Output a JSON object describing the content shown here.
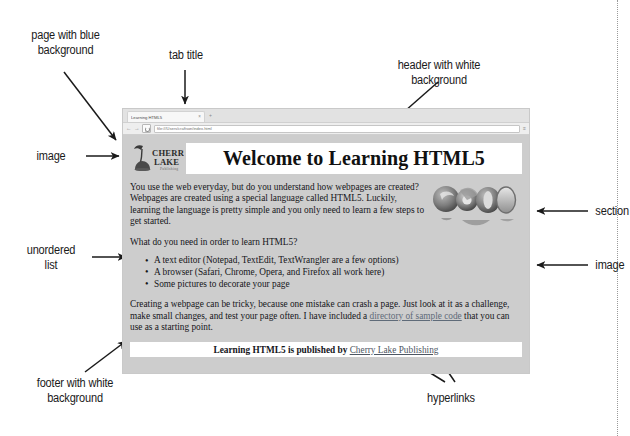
{
  "annotations": [
    {
      "id": "page-blue-bg",
      "text": "page with blue\nbackground"
    },
    {
      "id": "tab-title",
      "text": "tab title"
    },
    {
      "id": "header-white-bg",
      "text": "header with white\nbackground"
    },
    {
      "id": "image-left",
      "text": "image"
    },
    {
      "id": "unordered-list",
      "text": "unordered\nlist"
    },
    {
      "id": "section",
      "text": "section"
    },
    {
      "id": "image-right",
      "text": "image"
    },
    {
      "id": "footer-white-bg",
      "text": "footer with white\nbackground"
    },
    {
      "id": "hyperlinks",
      "text": "hyperlinks"
    }
  ],
  "browser": {
    "tab_title": "Learning HTML5",
    "tab_close_glyph": "×",
    "new_tab_glyph": "+",
    "back_glyph": "←",
    "forward_glyph": "→",
    "menu_glyph": "≡",
    "url": "file:///Users/craftson/index.html"
  },
  "page": {
    "logo": {
      "line1": "CHERRY",
      "line2": "LAKE",
      "line3": "Publishing"
    },
    "header_title": "Welcome to Learning HTML5",
    "paragraph1": "You use the web everyday, but do you understand how webpages are created? Webpages are created using a special language called HTML5. Luckily, learning the language is pretty simple and you only need to learn a few steps to get started.",
    "paragraph2": "What do you need in order to learn HTML5?",
    "list_items": [
      "A text editor (Notepad, TextEdit, TextWrangler are a few options)",
      "A browser (Safari, Chrome, Opera, and Firefox all work here)",
      "Some pictures to decorate your page"
    ],
    "paragraph3_before": "Creating a webpage can be tricky, because one mistake can crash a page. Just look at it as a challenge, make small changes, and test your page often. I have included a ",
    "paragraph3_link": "directory of sample code",
    "paragraph3_after": " that you can use as a starting point.",
    "footer_before": "Learning HTML5 is published by ",
    "footer_link": "Cherry Lake Publishing"
  },
  "colors": {
    "page_background": "#cdcdcd",
    "header_background": "#ffffff",
    "footer_background": "#ffffff",
    "link": "#5f6b79",
    "text": "#15151a"
  }
}
